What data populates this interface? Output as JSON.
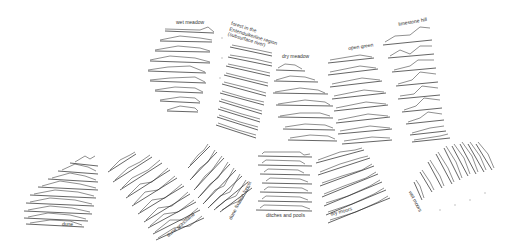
{
  "diagram": {
    "type": "landscape vegetation profile fans",
    "groups": [
      {
        "id": "wet-meadow",
        "label": "wet meadow",
        "profiles": 9
      },
      {
        "id": "forest-region",
        "label": "forest in the Entenduikerline region (subsurface river)",
        "profiles": 12
      },
      {
        "id": "dry-meadow",
        "label": "dry meadow",
        "profiles": 7
      },
      {
        "id": "open-green",
        "label": "open green",
        "profiles": 8
      },
      {
        "id": "limestone-hill",
        "label": "limestone hill",
        "profiles": 9
      },
      {
        "id": "dune",
        "label": "dune",
        "profiles": 9
      },
      {
        "id": "dune-grassland",
        "label": "dune grassland",
        "profiles": 10
      },
      {
        "id": "dune-fixation-forest",
        "label": "dune fixation forest",
        "profiles": 10
      },
      {
        "id": "ditches-and-pools",
        "label": "ditches and pools",
        "profiles": 7
      },
      {
        "id": "dry-moors",
        "label": "dry moors",
        "profiles": 7
      },
      {
        "id": "wet-moors",
        "label": "wet moors",
        "profiles": 9
      }
    ]
  }
}
